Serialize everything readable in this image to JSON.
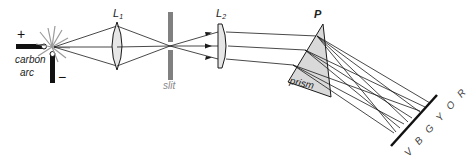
{
  "diagram": {
    "labels": {
      "plus": "+",
      "minus": "−",
      "carbon_arc_line1": "carbon",
      "carbon_arc_line2": "arc",
      "lens1_main": "L",
      "lens1_sub": "1",
      "slit": "slit",
      "lens2_main": "L",
      "lens2_sub": "2",
      "prism_letter": "P",
      "prism": "prism",
      "spectrum": "V B G Y O R"
    },
    "colors": {
      "line": "#1a1a1a",
      "slit": "#808080",
      "lens_fill": "#e6e6e6",
      "prism_fill": "#d9d9d9",
      "flash": "#9a9a9a"
    }
  }
}
